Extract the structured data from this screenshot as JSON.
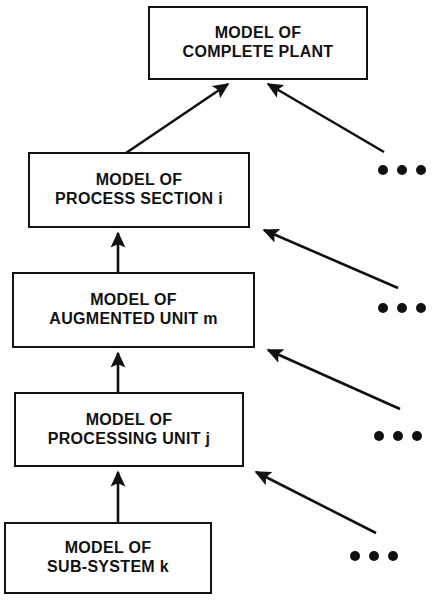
{
  "diagram": {
    "nodes": [
      {
        "id": "complete-plant",
        "line1": "MODEL OF",
        "line2": "COMPLETE PLANT"
      },
      {
        "id": "process-section",
        "line1": "MODEL OF",
        "line2": "PROCESS SECTION i"
      },
      {
        "id": "augmented-unit",
        "line1": "MODEL OF",
        "line2": "AUGMENTED UNIT m"
      },
      {
        "id": "processing-unit",
        "line1": "MODEL OF",
        "line2": "PROCESSING UNIT j"
      },
      {
        "id": "sub-system",
        "line1": "MODEL OF",
        "line2": "SUB-SYSTEM k"
      }
    ],
    "ellipses": [
      {
        "id": "ellipsis-1",
        "text": "..."
      },
      {
        "id": "ellipsis-2",
        "text": "..."
      },
      {
        "id": "ellipsis-3",
        "text": "..."
      },
      {
        "id": "ellipsis-4",
        "text": "..."
      }
    ],
    "colors": {
      "stroke": "#111111",
      "background": "#ffffff",
      "text": "#111111"
    },
    "arrows": [
      {
        "id": "arrow-process-section-to-complete-plant",
        "from": "process-section",
        "to": "complete-plant"
      },
      {
        "id": "arrow-peer-to-complete-plant",
        "from": "peer-group-1",
        "to": "complete-plant"
      },
      {
        "id": "arrow-augmented-unit-to-process-section",
        "from": "augmented-unit",
        "to": "process-section"
      },
      {
        "id": "arrow-peer-to-process-section",
        "from": "peer-group-2",
        "to": "process-section"
      },
      {
        "id": "arrow-processing-unit-to-augmented-unit",
        "from": "processing-unit",
        "to": "augmented-unit"
      },
      {
        "id": "arrow-peer-to-augmented-unit",
        "from": "peer-group-3",
        "to": "augmented-unit"
      },
      {
        "id": "arrow-sub-system-to-processing-unit",
        "from": "sub-system",
        "to": "processing-unit"
      },
      {
        "id": "arrow-peer-to-processing-unit",
        "from": "peer-group-4",
        "to": "processing-unit"
      }
    ]
  }
}
